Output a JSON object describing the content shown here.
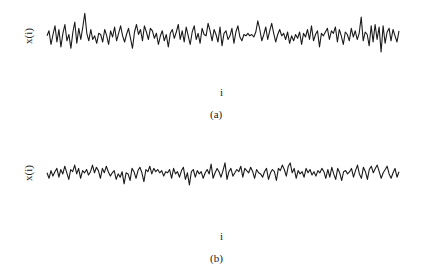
{
  "chart_data": [
    {
      "type": "line",
      "title": "",
      "caption": "(a)",
      "xlabel": "i",
      "ylabel": "x(i)",
      "grid": false,
      "axes_visible": false,
      "n_points": 176,
      "x_pixel_range": [
        47,
        399
      ],
      "y_pixel_center": 37,
      "y_pixel_amplitude": 25,
      "values": [
        0.1,
        0.5,
        -0.6,
        0.2,
        0.9,
        -0.4,
        0.6,
        -0.8,
        0.3,
        1.0,
        -0.3,
        0.2,
        -0.9,
        0.4,
        1.2,
        -0.5,
        0.7,
        -0.2,
        0.8,
        1.9,
        0.3,
        -0.3,
        0.6,
        -0.2,
        0.1,
        -0.5,
        0.3,
        0.2,
        -0.4,
        0.6,
        0.1,
        -0.6,
        0.5,
        0.0,
        0.8,
        -0.3,
        0.3,
        0.9,
        0.1,
        -0.4,
        0.2,
        0.7,
        -0.1,
        -0.9,
        0.4,
        1.0,
        0.2,
        0.6,
        -0.3,
        0.9,
        0.4,
        -0.2,
        0.7,
        0.5,
        -0.1,
        0.3,
        -0.6,
        0.1,
        0.5,
        -0.3,
        0.2,
        -0.8,
        0.3,
        0.6,
        -0.1,
        0.4,
        1.0,
        -0.2,
        0.5,
        -0.4,
        0.8,
        0.1,
        -0.6,
        0.4,
        0.9,
        -0.2,
        0.3,
        -0.5,
        0.7,
        0.2,
        0.1,
        1.1,
        0.5,
        -0.3,
        0.6,
        0.2,
        -0.4,
        0.8,
        -0.7,
        0.3,
        0.5,
        -0.2,
        0.1,
        0.7,
        -0.5,
        0.4,
        0.9,
        0.0,
        -0.3,
        0.2,
        0.1,
        0.3,
        0.1,
        0.2,
        0.0,
        0.4,
        1.3,
        0.6,
        -0.3,
        0.2,
        0.8,
        -0.2,
        0.5,
        1.1,
        0.3,
        -0.4,
        0.2,
        0.6,
        0.1,
        0.3,
        -0.2,
        0.4,
        -0.5,
        0.1,
        -0.3,
        0.2,
        -0.1,
        0.4,
        -0.6,
        0.3,
        0.0,
        0.6,
        -0.2,
        0.9,
        -0.3,
        0.2,
        0.5,
        -0.8,
        0.3,
        0.1,
        0.4,
        0.7,
        -0.2,
        0.5,
        0.3,
        0.8,
        -0.4,
        0.6,
        0.1,
        -0.6,
        0.4,
        0.2,
        -0.3,
        0.7,
        0.0,
        0.5,
        -0.2,
        0.3,
        1.6,
        -0.3,
        0.4,
        0.2,
        -0.7,
        0.9,
        -0.4,
        1.0,
        -0.2,
        0.8,
        -1.2,
        0.9,
        -0.5,
        0.4,
        0.7,
        -0.3,
        0.6,
        0.1,
        -0.4,
        0.5
      ],
      "ylim": [
        -2,
        2
      ]
    },
    {
      "type": "line",
      "title": "",
      "caption": "(b)",
      "xlabel": "i",
      "ylabel": "x(i)",
      "grid": false,
      "axes_visible": false,
      "n_points": 176,
      "x_pixel_range": [
        47,
        399
      ],
      "y_pixel_center": 175,
      "y_pixel_amplitude": 22,
      "values": [
        0.2,
        -0.3,
        0.4,
        -0.1,
        0.3,
        0.6,
        -0.2,
        0.5,
        0.1,
        0.8,
        0.2,
        -0.4,
        0.5,
        0.3,
        0.9,
        0.1,
        0.6,
        -0.3,
        0.4,
        0.2,
        0.5,
        0.0,
        0.3,
        0.9,
        0.2,
        0.7,
        0.4,
        -0.3,
        0.6,
        0.2,
        0.8,
        0.3,
        -0.1,
        0.2,
        0.4,
        -0.4,
        0.1,
        -0.2,
        0.3,
        -0.8,
        0.2,
        0.1,
        -0.5,
        0.6,
        0.3,
        -0.3,
        0.4,
        0.7,
        0.2,
        -0.6,
        0.5,
        0.3,
        0.8,
        0.1,
        0.6,
        0.3,
        0.5,
        0.2,
        0.4,
        -0.1,
        0.3,
        0.2,
        0.5,
        -0.3,
        0.6,
        0.1,
        0.3,
        -0.2,
        0.4,
        0.7,
        -0.4,
        0.2,
        -0.9,
        0.3,
        0.5,
        -0.2,
        0.4,
        0.1,
        0.3,
        -0.3,
        0.2,
        0.5,
        0.1,
        1.0,
        -0.3,
        0.2,
        0.6,
        0.3,
        -0.2,
        0.4,
        1.1,
        -0.4,
        0.3,
        0.6,
        -0.1,
        0.2,
        0.5,
        0.3,
        0.8,
        -0.2,
        0.6,
        0.4,
        0.2,
        0.7,
        0.3,
        -0.3,
        0.5,
        0.2,
        0.1,
        -0.2,
        0.3,
        0.6,
        -0.4,
        0.2,
        0.5,
        0.3,
        -0.5,
        0.6,
        0.4,
        0.9,
        0.5,
        -0.1,
        0.8,
        1.1,
        0.2,
        0.6,
        -0.3,
        0.4,
        0.1,
        0.3,
        -0.2,
        0.6,
        0.2,
        0.5,
        0.0,
        0.3,
        -0.1,
        0.4,
        0.2,
        0.6,
        0.3,
        -0.3,
        0.5,
        -0.2,
        0.7,
        0.1,
        -0.4,
        0.6,
        0.2,
        -0.5,
        0.3,
        0.4,
        0.1,
        0.3,
        0.6,
        -0.2,
        0.4,
        0.9,
        0.1,
        -0.3,
        0.7,
        0.3,
        -0.4,
        0.5,
        0.8,
        0.2,
        0.6,
        0.9,
        0.3,
        -0.3,
        0.2,
        0.5,
        0.8,
        0.1,
        -0.3,
        0.2,
        0.6,
        -0.2,
        0.3
      ],
      "ylim": [
        -2,
        2
      ]
    }
  ],
  "panels": {
    "a": {
      "ylabel": "x(i)",
      "xlabel": "i",
      "caption": "(a)"
    },
    "b": {
      "ylabel": "x(i)",
      "xlabel": "i",
      "caption": "(b)"
    }
  },
  "colors": {
    "line": "#1a1a1a",
    "background": "#ffffff",
    "text": "#222222"
  }
}
